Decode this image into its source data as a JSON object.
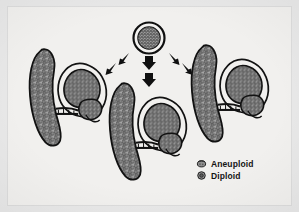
{
  "figure": {
    "domain": "diagram",
    "title": "",
    "background_color": "#e8e8e8",
    "plate_color": "#f1f0ee",
    "ink_color": "#101010",
    "cell_fill_color": "#9a9a9a"
  },
  "source_cell": {
    "name": "oocyte",
    "label": "",
    "shape": "circle",
    "texture": "stippled-granular",
    "center_x": 149,
    "center_y": 38,
    "radius": 15
  },
  "arrows": [
    {
      "id": "arrow-left",
      "direction": "down-left",
      "segments": 2
    },
    {
      "id": "arrow-center",
      "direction": "down",
      "segments": 2
    },
    {
      "id": "arrow-right",
      "direction": "down-right",
      "segments": 2
    }
  ],
  "units": [
    {
      "id": "unit-left",
      "label": "",
      "placenta": {
        "name": "placenta",
        "shape": "crescent",
        "texture": "stippled-granular"
      },
      "fetus": {
        "name": "fetus",
        "shape": "curled",
        "texture": "stippled-granular"
      },
      "cord": {
        "name": "umbilical-cord"
      },
      "sac": {
        "name": "amniotic-sac"
      }
    },
    {
      "id": "unit-center",
      "label": "",
      "placenta": {
        "name": "placenta",
        "shape": "crescent",
        "texture": "stippled-granular"
      },
      "fetus": {
        "name": "fetus",
        "shape": "curled",
        "texture": "stippled-granular"
      },
      "cord": {
        "name": "umbilical-cord"
      },
      "sac": {
        "name": "amniotic-sac"
      }
    },
    {
      "id": "unit-right",
      "label": "",
      "placenta": {
        "name": "placenta",
        "shape": "crescent",
        "texture": "stippled-granular"
      },
      "fetus": {
        "name": "fetus",
        "shape": "curled",
        "texture": "stippled-granular"
      },
      "cord": {
        "name": "umbilical-cord"
      },
      "sac": {
        "name": "amniotic-sac"
      }
    }
  ],
  "legend": {
    "position": "bottom-right",
    "items": [
      {
        "label": "Aneuploid",
        "icon": "aneuploid-cell-icon",
        "swatch_fill": "#8f8f8f"
      },
      {
        "label": "Diploid",
        "icon": "diploid-cell-icon",
        "swatch_fill": "#8f8f8f"
      }
    ]
  }
}
